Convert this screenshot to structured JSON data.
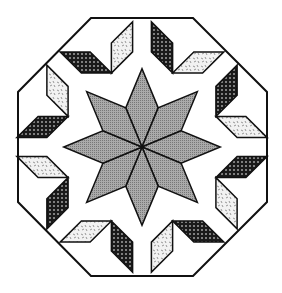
{
  "figure": {
    "colors": {
      "background": "#ffffff",
      "outline": "#111111",
      "center_star": "#9a9a9a",
      "dotted_fabric": "#1a1a1a",
      "floral_fabric": "#e8e8e8"
    },
    "center": [
      142,
      147
    ],
    "octagon_vertices": [
      [
        91,
        18
      ],
      [
        193,
        18
      ],
      [
        267,
        92
      ],
      [
        267,
        202
      ],
      [
        193,
        276
      ],
      [
        91,
        276
      ],
      [
        18,
        202
      ],
      [
        18,
        92
      ]
    ],
    "fabrics": [
      "gray-crosshatch",
      "black-dotted",
      "white-floral"
    ]
  }
}
